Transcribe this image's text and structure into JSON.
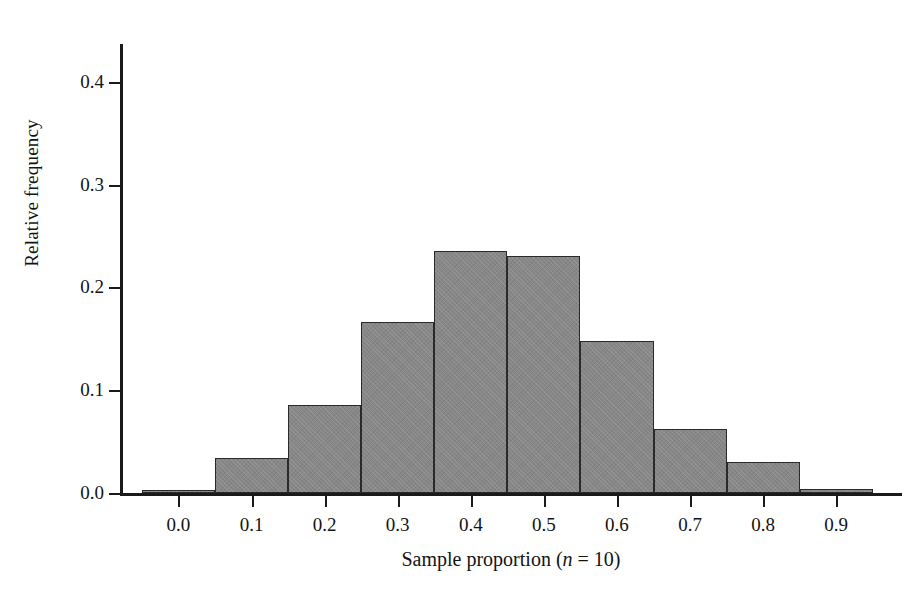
{
  "chart_data": {
    "type": "bar",
    "title": "",
    "subtitle": "",
    "xlabel": "Sample proportion (n = 10)",
    "xlabel_prefix": "Sample proportion (",
    "xlabel_italic": "n",
    "xlabel_suffix": " = 10)",
    "ylabel": "Relative frequency",
    "categories": [
      "0.0",
      "0.1",
      "0.2",
      "0.3",
      "0.4",
      "0.5",
      "0.6",
      "0.7",
      "0.8",
      "0.9"
    ],
    "values": [
      0.002,
      0.034,
      0.086,
      0.166,
      0.236,
      0.231,
      0.148,
      0.062,
      0.03,
      0.004
    ],
    "bin_edges": [
      -0.05,
      0.05,
      0.15,
      0.25,
      0.35,
      0.45,
      0.55,
      0.65,
      0.75,
      0.85,
      0.95
    ],
    "bin_width": 0.1,
    "xlim": [
      -0.08,
      0.99
    ],
    "ylim": [
      0.0,
      0.435
    ],
    "xticks": [
      "0.0",
      "0.1",
      "0.2",
      "0.3",
      "0.4",
      "0.5",
      "0.6",
      "0.7",
      "0.8",
      "0.9"
    ],
    "xtick_values": [
      0.0,
      0.1,
      0.2,
      0.3,
      0.4,
      0.5,
      0.6,
      0.7,
      0.8,
      0.9
    ],
    "yticks": [
      "0.0",
      "0.1",
      "0.2",
      "0.3",
      "0.4"
    ],
    "ytick_values": [
      0.0,
      0.1,
      0.2,
      0.3,
      0.4
    ],
    "grid": false,
    "legend": null,
    "legend_position": "none",
    "bar_fill_color": "#878787",
    "bar_edge_color": "#2a2a2a",
    "axis_color": "#1a1a1a",
    "background_color": "#ffffff"
  }
}
